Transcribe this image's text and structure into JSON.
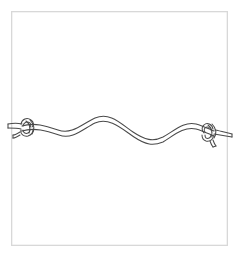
{
  "illustration": {
    "title": "Rope with overhand knots at both ends",
    "subject": "knotted-rope",
    "style": "line-art-drawing",
    "background_color": "#ffffff",
    "frame": {
      "label": "Image border frame",
      "stroke_color": "#d8d8d8",
      "stroke_width": 1.3,
      "fill_color": "#ffffff",
      "x": 11,
      "y": 11,
      "width": 217,
      "height": 235
    },
    "rope": {
      "label": "Rope",
      "stroke_color": "#4a4a4a",
      "stroke_width": 1.05,
      "thickness": 4.2,
      "rendering": "double-line outline",
      "orientation": "horizontal",
      "wave_description": "gentle S-wave with one crest left of center, one trough right of center, and a second low crest near the right knot",
      "path_upper": "M 22,126 C 34,122 46,126 58,130 C 72,135 82,124 95,118 C 110,112 120,123 133,132 C 145,140 153,142 163,137 C 174,131 184,121 196,124 C 203,126 209,129 214,131",
      "path_lower": "M 22,131 C 34,127 47,131 59,135 C 72,140 83,129 95,123 C 109,117 121,128 134,137 C 146,145 153,146 163,142 C 173,136 184,126 196,129 C 203,131 209,134 214,136"
    },
    "knots": [
      {
        "name": "left-overhand-knot",
        "label": "Overhand knot (left end)",
        "center_x": 27,
        "center_y": 129,
        "radius": 7,
        "tail_direction": "left",
        "tail_end_x": 8,
        "tail_end_y": 126
      },
      {
        "name": "right-overhand-knot",
        "label": "Overhand knot (right end)",
        "center_x": 212,
        "center_y": 133,
        "radius": 7,
        "tail_direction": "right",
        "tail_end_x": 232,
        "tail_end_y": 135
      }
    ]
  }
}
